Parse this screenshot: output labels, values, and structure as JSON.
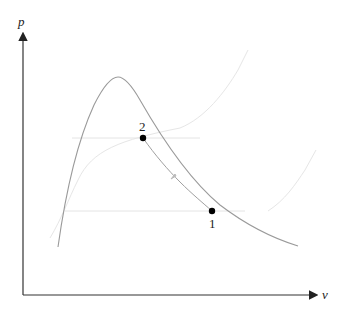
{
  "diagram": {
    "type": "p-v thermodynamic diagram",
    "axes": {
      "y_label": "p",
      "x_label": "v"
    },
    "points": [
      {
        "id": "1",
        "label": "1"
      },
      {
        "id": "2",
        "label": "2"
      }
    ],
    "curves": [
      {
        "name": "saturation-dome",
        "description": "bell-shaped saturation curve"
      },
      {
        "name": "isotherm-high",
        "description": "faint curve through state 2 level"
      },
      {
        "name": "isotherm-low",
        "description": "faint curve through state 1 level"
      },
      {
        "name": "process-1-2",
        "description": "compression path from 1 to 2 with direction arrow"
      }
    ],
    "colors": {
      "axis": "#333333",
      "dome": "#9a9a9a",
      "process": "#8f8f8f",
      "faint": "#e2e2e2",
      "point": "#000000"
    }
  }
}
